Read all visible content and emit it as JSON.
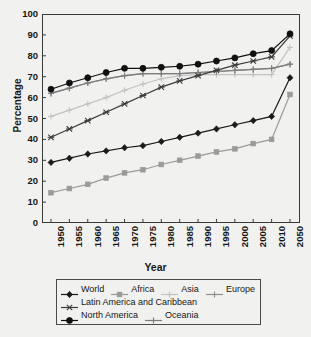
{
  "chart_data": {
    "type": "line",
    "title": "",
    "xlabel": "Year",
    "ylabel": "Percentage",
    "ylim": [
      0,
      100
    ],
    "ytick_step": 10,
    "yticks": [
      0,
      10,
      20,
      30,
      40,
      50,
      60,
      70,
      80,
      90,
      100
    ],
    "grid": false,
    "legend_position": "bottom",
    "categories": [
      "1950",
      "1955",
      "1960",
      "1965",
      "1970",
      "1975",
      "1980",
      "1985",
      "1990",
      "1995",
      "2000",
      "2005",
      "2010",
      "2050"
    ],
    "series": [
      {
        "name": "World",
        "color": "#1a1a1a",
        "marker": "diamond",
        "values": [
          29,
          31,
          33,
          34.5,
          36,
          37,
          39,
          41,
          43,
          45,
          47,
          49,
          51,
          69.5
        ]
      },
      {
        "name": "Africa",
        "color": "#9a9a9a",
        "marker": "square",
        "values": [
          14.5,
          16.5,
          18.5,
          21.5,
          24,
          25.5,
          28,
          30,
          32,
          34,
          35.5,
          38,
          40,
          61.5
        ]
      },
      {
        "name": "Asia",
        "color": "#c2c2c2",
        "marker": "plus",
        "values": [
          51,
          54,
          57,
          60,
          63.5,
          66.5,
          69,
          70.5,
          71,
          71,
          71,
          71,
          71,
          84
        ]
      },
      {
        "name": "Europe",
        "color": "#8f8f8f",
        "marker": "plus",
        "values": [
          62,
          64.5,
          67,
          69,
          70.5,
          71.5,
          71.5,
          71.5,
          72,
          72.5,
          73,
          73.5,
          74,
          76
        ]
      },
      {
        "name": "Latin America and Caribbean",
        "color": "#3c3c3c",
        "marker": "cross",
        "values": [
          41,
          45,
          49,
          53,
          57,
          61,
          65,
          68,
          70.5,
          73,
          75.5,
          77.5,
          79.5,
          89.5
        ]
      },
      {
        "name": "North America",
        "color": "#101010",
        "marker": "circle",
        "values": [
          64,
          67,
          69.5,
          72,
          74,
          74,
          74.5,
          75,
          76,
          77.5,
          79,
          81,
          82.5,
          90.5
        ]
      },
      {
        "name": "Oceania",
        "color": "#7d7d7d",
        "marker": "plus",
        "values": [
          62,
          64.5,
          67,
          69,
          70.5,
          71.5,
          71.5,
          71.5,
          72,
          72.5,
          73,
          73.5,
          74,
          76
        ]
      }
    ]
  },
  "axes": {
    "y_title": "Percentage",
    "x_title": "Year"
  },
  "legend": {
    "rows": [
      [
        {
          "label": "World",
          "marker": "diamond",
          "color": "#1a1a1a"
        },
        {
          "label": "Africa",
          "marker": "square",
          "color": "#9a9a9a"
        },
        {
          "label": "Asia",
          "marker": "plus",
          "color": "#c2c2c2"
        },
        {
          "label": "Europe",
          "marker": "plus",
          "color": "#8f8f8f"
        }
      ],
      [
        {
          "label": "Latin America and Caribbean",
          "marker": "cross",
          "color": "#3c3c3c"
        }
      ],
      [
        {
          "label": "North America",
          "marker": "circle",
          "color": "#101010"
        },
        {
          "label": "Oceania",
          "marker": "plus",
          "color": "#7d7d7d"
        }
      ]
    ]
  }
}
